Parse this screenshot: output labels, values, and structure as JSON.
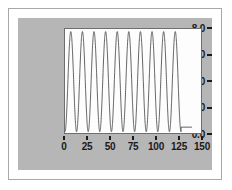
{
  "figure": {
    "background_color": "#b6b6b6",
    "plot_background_color": "#fdfdfd",
    "frame_color": "#a8a8a8",
    "axis_color": "#1a1a1a",
    "line_color": "#3c3c3c"
  },
  "chart_data": {
    "type": "line",
    "title": "",
    "subtitle": "",
    "xlabel": "",
    "ylabel": "",
    "xlim": [
      0,
      150
    ],
    "ylim": [
      0,
      8.0
    ],
    "grid": false,
    "legend": [],
    "legend_position": "none",
    "x_ticks": [
      0,
      25,
      50,
      75,
      100,
      125,
      150
    ],
    "x_tick_labels": [
      "0",
      "25",
      "50",
      "75",
      "100",
      "125",
      "150"
    ],
    "y_ticks": [
      0.0,
      2.0,
      4.0,
      6.0,
      8.0
    ],
    "y_tick_labels": [
      "0.0",
      "2.0",
      "4.0",
      "6.0",
      "8.0"
    ],
    "series": [
      {
        "name": "oscillation",
        "description": "high-frequency damped-envelope sinusoid, 10 cycles from x=0 to x=128, then flat tail",
        "amplitude": 3.85,
        "offset": 3.95,
        "cycles": 10,
        "x_start": 0,
        "x_end": 128,
        "peak_value": 7.8,
        "trough_value": 0.1,
        "tail_value": 0.45,
        "x": [
          0,
          3,
          6,
          9,
          13,
          16,
          19,
          22,
          26,
          29,
          32,
          35,
          38,
          42,
          45,
          48,
          51,
          54,
          58,
          61,
          64,
          67,
          70,
          74,
          77,
          80,
          83,
          86,
          90,
          93,
          96,
          99,
          102,
          106,
          109,
          112,
          115,
          118,
          122,
          125,
          128,
          132,
          136,
          140
        ],
        "values": [
          0.3,
          3.9,
          7.6,
          5.2,
          0.5,
          1.2,
          6.1,
          7.4,
          2.4,
          0.2,
          4.6,
          7.8,
          4.0,
          0.2,
          2.0,
          7.0,
          6.6,
          1.4,
          0.4,
          5.4,
          7.8,
          3.0,
          0.2,
          3.2,
          7.7,
          5.0,
          0.6,
          1.4,
          6.4,
          7.2,
          2.1,
          0.2,
          4.9,
          7.8,
          3.7,
          0.2,
          2.3,
          7.2,
          6.3,
          1.2,
          0.45,
          0.45,
          0.45,
          0.45
        ]
      }
    ]
  }
}
